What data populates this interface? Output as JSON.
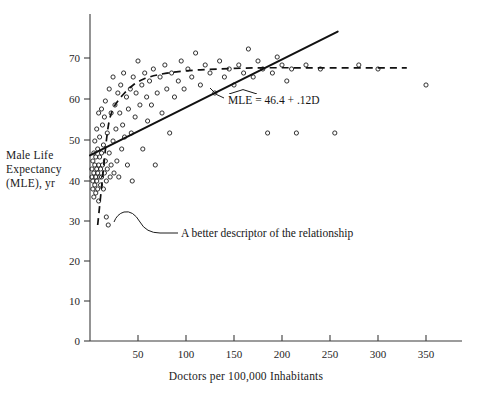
{
  "chart_data": {
    "type": "scatter",
    "title": "",
    "xlabel": "Doctors per 100,000 Inhabitants",
    "ylabel_lines": [
      "Male Life",
      "Expectancy",
      "(MLE), yr"
    ],
    "ylabel": "Male Life Expectancy (MLE), yr",
    "xlim": [
      0,
      385
    ],
    "ylim": [
      0,
      78
    ],
    "xticks": [
      0,
      50,
      100,
      150,
      200,
      250,
      300,
      350
    ],
    "xtick_labels": [
      "0",
      "50",
      "100",
      "150",
      "200",
      "250",
      "300",
      "350"
    ],
    "yticks": [
      0,
      10,
      20,
      30,
      40,
      50,
      60,
      70
    ],
    "ytick_labels": [
      "0",
      "10",
      "20",
      "30",
      "40",
      "50",
      "60",
      "70"
    ],
    "grid": false,
    "legend": "none",
    "marker": "open-circle",
    "points": [
      [
        2,
        41
      ],
      [
        2,
        43
      ],
      [
        3,
        38
      ],
      [
        3,
        45
      ],
      [
        3,
        40
      ],
      [
        4,
        36
      ],
      [
        4,
        42
      ],
      [
        4,
        47
      ],
      [
        5,
        39
      ],
      [
        5,
        44
      ],
      [
        5,
        50
      ],
      [
        6,
        41
      ],
      [
        6,
        37
      ],
      [
        6,
        46
      ],
      [
        7,
        43
      ],
      [
        7,
        53
      ],
      [
        7,
        40
      ],
      [
        8,
        38
      ],
      [
        8,
        48
      ],
      [
        8,
        42
      ],
      [
        9,
        44
      ],
      [
        9,
        35
      ],
      [
        9,
        57
      ],
      [
        10,
        41
      ],
      [
        10,
        46
      ],
      [
        10,
        51
      ],
      [
        11,
        39
      ],
      [
        11,
        43
      ],
      [
        12,
        58
      ],
      [
        12,
        47
      ],
      [
        12,
        41
      ],
      [
        13,
        54
      ],
      [
        13,
        44
      ],
      [
        14,
        38
      ],
      [
        14,
        49
      ],
      [
        15,
        56
      ],
      [
        15,
        42
      ],
      [
        16,
        60
      ],
      [
        16,
        45
      ],
      [
        17,
        31
      ],
      [
        17,
        40
      ],
      [
        18,
        52
      ],
      [
        18,
        43
      ],
      [
        19,
        29
      ],
      [
        20,
        63
      ],
      [
        20,
        47
      ],
      [
        21,
        41
      ],
      [
        22,
        57
      ],
      [
        22,
        44
      ],
      [
        24,
        66
      ],
      [
        24,
        50
      ],
      [
        25,
        42
      ],
      [
        26,
        59
      ],
      [
        27,
        53
      ],
      [
        28,
        45
      ],
      [
        29,
        62
      ],
      [
        30,
        41
      ],
      [
        31,
        57
      ],
      [
        32,
        64
      ],
      [
        33,
        48
      ],
      [
        34,
        54
      ],
      [
        35,
        67
      ],
      [
        36,
        51
      ],
      [
        38,
        61
      ],
      [
        39,
        44
      ],
      [
        40,
        58
      ],
      [
        42,
        63
      ],
      [
        43,
        52
      ],
      [
        44,
        40
      ],
      [
        45,
        66
      ],
      [
        47,
        56
      ],
      [
        48,
        62
      ],
      [
        50,
        70
      ],
      [
        52,
        59
      ],
      [
        54,
        64
      ],
      [
        55,
        48
      ],
      [
        57,
        67
      ],
      [
        59,
        61
      ],
      [
        60,
        55
      ],
      [
        62,
        65
      ],
      [
        64,
        59
      ],
      [
        66,
        68
      ],
      [
        68,
        44
      ],
      [
        70,
        62
      ],
      [
        73,
        66
      ],
      [
        75,
        57
      ],
      [
        78,
        69
      ],
      [
        80,
        63
      ],
      [
        83,
        52
      ],
      [
        85,
        67
      ],
      [
        88,
        61
      ],
      [
        92,
        65
      ],
      [
        95,
        70
      ],
      [
        98,
        63
      ],
      [
        102,
        68
      ],
      [
        106,
        66
      ],
      [
        110,
        72
      ],
      [
        115,
        64
      ],
      [
        120,
        69
      ],
      [
        125,
        67
      ],
      [
        130,
        62
      ],
      [
        135,
        70
      ],
      [
        140,
        66
      ],
      [
        145,
        68
      ],
      [
        150,
        64
      ],
      [
        155,
        69
      ],
      [
        160,
        67
      ],
      [
        165,
        73
      ],
      [
        170,
        66
      ],
      [
        175,
        70
      ],
      [
        180,
        68
      ],
      [
        185,
        52
      ],
      [
        190,
        67
      ],
      [
        195,
        71
      ],
      [
        200,
        69
      ],
      [
        205,
        65
      ],
      [
        210,
        68
      ],
      [
        215,
        52
      ],
      [
        225,
        69
      ],
      [
        240,
        68
      ],
      [
        255,
        52
      ],
      [
        280,
        69
      ],
      [
        300,
        68
      ],
      [
        350,
        64
      ]
    ],
    "regression": {
      "label": "MLE = 46.4 + .12D",
      "label_hat_over": "MLE",
      "intercept": 46.4,
      "slope": 0.12,
      "x_start": 0,
      "x_end": 258,
      "style": "solid"
    },
    "smoother": {
      "label": "A better descriptor of the relationship",
      "style": "dashed",
      "points": [
        [
          8,
          29
        ],
        [
          11,
          36
        ],
        [
          14,
          43
        ],
        [
          17,
          50
        ],
        [
          20,
          55
        ],
        [
          24,
          58
        ],
        [
          29,
          60
        ],
        [
          36,
          62
        ],
        [
          45,
          64
        ],
        [
          56,
          65.5
        ],
        [
          70,
          66.5
        ],
        [
          90,
          67.3
        ],
        [
          115,
          67.8
        ],
        [
          145,
          68.1
        ],
        [
          180,
          68.3
        ],
        [
          220,
          68.3
        ],
        [
          265,
          68.3
        ],
        [
          330,
          68.3
        ]
      ]
    }
  }
}
